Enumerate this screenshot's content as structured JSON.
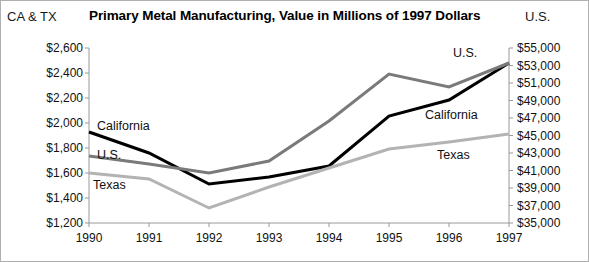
{
  "chart_data": {
    "type": "line",
    "title": "Primary Metal Manufacturing, Value in Millions of 1997 Dollars",
    "left_axis_title": "CA & TX",
    "right_axis_title": "U.S.",
    "xlabel": "",
    "categories": [
      "1990",
      "1991",
      "1992",
      "1993",
      "1994",
      "1995",
      "1996",
      "1997"
    ],
    "grid": false,
    "legend_position": "inline-labels",
    "left_axis": {
      "label": "CA & TX",
      "ylim": [
        1200,
        2600
      ],
      "tick_step": 200,
      "ticks": [
        "$1,200",
        "$1,400",
        "$1,600",
        "$1,800",
        "$2,000",
        "$2,200",
        "$2,400",
        "$2,600"
      ],
      "tick_values": [
        1200,
        1400,
        1600,
        1800,
        2000,
        2200,
        2400,
        2600
      ]
    },
    "right_axis": {
      "label": "U.S.",
      "ylim": [
        35000,
        55000
      ],
      "tick_step": 2000,
      "ticks": [
        "$35,000",
        "$37,000",
        "$39,000",
        "$41,000",
        "$43,000",
        "$45,000",
        "$47,000",
        "$49,000",
        "$51,000",
        "$53,000",
        "$55,000"
      ],
      "tick_values": [
        35000,
        37000,
        39000,
        41000,
        43000,
        45000,
        47000,
        49000,
        51000,
        53000,
        55000
      ]
    },
    "series": [
      {
        "name": "California",
        "axis": "left",
        "color": "#000000",
        "width": 3,
        "values": [
          1928,
          1760,
          1512,
          1568,
          1656,
          2056,
          2184,
          2480
        ]
      },
      {
        "name": "U.S.",
        "axis": "right",
        "color": "#7a7a7a",
        "width": 3,
        "values": [
          42657,
          41743,
          40714,
          42086,
          46657,
          52029,
          50543,
          53286
        ]
      },
      {
        "name": "Texas",
        "axis": "left",
        "color": "#b3b3b3",
        "width": 3,
        "values": [
          1600,
          1552,
          1320,
          1488,
          1640,
          1792,
          1848,
          1912
        ]
      }
    ],
    "annotations": [
      {
        "text": "California",
        "x": 96,
        "y": 119,
        "series": "California"
      },
      {
        "text": "U.S.",
        "x": 96,
        "y": 148,
        "series": "U.S."
      },
      {
        "text": "Texas",
        "x": 92,
        "y": 178,
        "series": "Texas"
      },
      {
        "text": "U.S.",
        "x": 452,
        "y": 46,
        "series": "U.S."
      },
      {
        "text": "California",
        "x": 424,
        "y": 108,
        "series": "California"
      },
      {
        "text": "Texas",
        "x": 436,
        "y": 148,
        "series": "Texas"
      }
    ],
    "colors": {
      "california": "#000000",
      "us": "#7a7a7a",
      "texas": "#b3b3b3",
      "axis": "#9a9a9a",
      "border": "#b0b0b0",
      "text": "#111111"
    }
  }
}
